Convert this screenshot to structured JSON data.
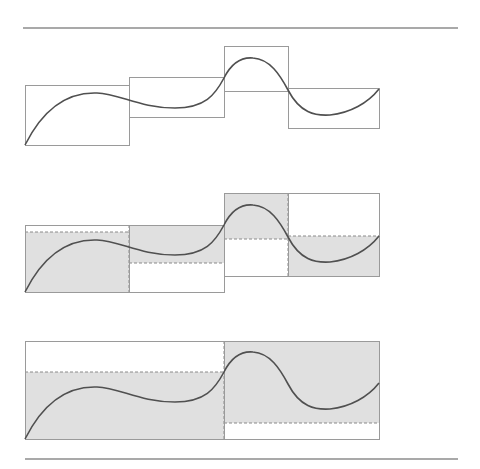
{
  "figure": {
    "colors": {
      "rule": "#555555",
      "box": "#9a9a9a",
      "curve": "#505050",
      "fill": "#e0e0e0",
      "dash": "#8a8a8a"
    },
    "rules": [
      {
        "x1": 23,
        "x2": 458,
        "y": 28
      },
      {
        "x1": 25,
        "x2": 458,
        "y": 459
      }
    ],
    "panels": [
      {
        "id": "panel-1",
        "offset_y": 0,
        "boxes": [
          {
            "x": 25,
            "y": 85,
            "w": 104,
            "h": 60,
            "filled": false
          },
          {
            "x": 129,
            "y": 77,
            "w": 95,
            "h": 40,
            "filled": false
          },
          {
            "x": 224,
            "y": 46,
            "w": 64,
            "h": 45,
            "filled": false
          },
          {
            "x": 288,
            "y": 88,
            "w": 91,
            "h": 40,
            "filled": false
          }
        ]
      },
      {
        "id": "panel-2",
        "offset_y": 147,
        "boxes": [
          {
            "x": 25,
            "y": 225,
            "w": 104,
            "h": 67,
            "fill_y": 232,
            "fill_h": 60
          },
          {
            "x": 129,
            "y": 225,
            "w": 95,
            "h": 67,
            "fill_y": 225,
            "fill_h": 38
          },
          {
            "x": 224,
            "y": 193,
            "w": 64,
            "h": 83,
            "fill_y": 193,
            "fill_h": 46
          },
          {
            "x": 288,
            "y": 193,
            "w": 91,
            "h": 83,
            "fill_y": 236,
            "fill_h": 40
          }
        ],
        "dashed_lines": [
          {
            "x1": 25,
            "y1": 232,
            "x2": 129,
            "y2": 232
          },
          {
            "x1": 129,
            "y1": 263,
            "x2": 224,
            "y2": 263
          },
          {
            "x1": 224,
            "y1": 239,
            "x2": 288,
            "y2": 239
          },
          {
            "x1": 288,
            "y1": 236,
            "x2": 379,
            "y2": 236
          },
          {
            "x1": 129,
            "y1": 225,
            "x2": 129,
            "y2": 292
          },
          {
            "x1": 288,
            "y1": 193,
            "x2": 288,
            "y2": 276
          }
        ]
      },
      {
        "id": "panel-3",
        "offset_y": 294,
        "boxes": [
          {
            "x": 25,
            "y": 341,
            "w": 199,
            "h": 98,
            "fill_y": 372,
            "fill_h": 67
          },
          {
            "x": 224,
            "y": 341,
            "w": 155,
            "h": 98,
            "fill_y": 341,
            "fill_h": 82
          }
        ],
        "dashed_lines": [
          {
            "x1": 25,
            "y1": 372,
            "x2": 224,
            "y2": 372
          },
          {
            "x1": 224,
            "y1": 423,
            "x2": 379,
            "y2": 423
          },
          {
            "x1": 224,
            "y1": 341,
            "x2": 224,
            "y2": 439
          }
        ]
      }
    ],
    "curve_path": "M25,145 C45,105 70,92 97,93 C120,94 140,108 175,108 C205,108 215,95 224,78 C232,62 242,57 253,58 C270,59 280,75 288,90 C300,113 315,116 330,115 C350,113 368,103 379,89"
  }
}
